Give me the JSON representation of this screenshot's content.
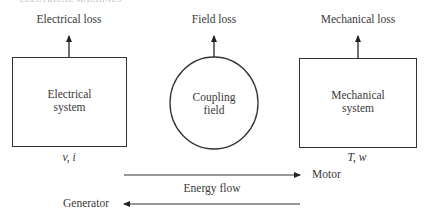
{
  "header": {
    "running_title": "ELECTRICAL MACHINES"
  },
  "diagram": {
    "electrical": {
      "loss_label": "Electrical loss",
      "block_line1": "Electrical",
      "block_line2": "system",
      "variables": "v, i"
    },
    "coupling": {
      "loss_label": "Field loss",
      "block_line1": "Coupling",
      "block_line2": "field"
    },
    "mechanical": {
      "loss_label": "Mechanical loss",
      "block_line1": "Mechanical",
      "block_line2": "system",
      "variables": "T, w"
    },
    "energy_flow": {
      "label": "Energy flow",
      "forward_label": "Motor",
      "reverse_label": "Generator"
    },
    "colors": {
      "stroke": "#333333",
      "text": "#3a3a3a"
    }
  }
}
